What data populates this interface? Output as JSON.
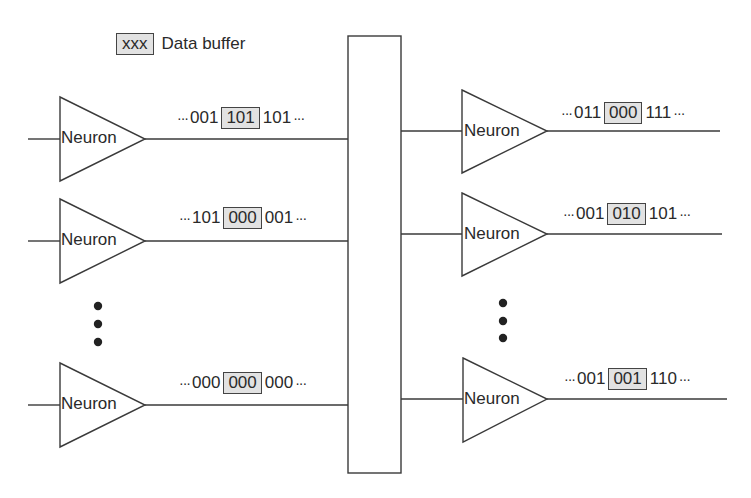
{
  "legend": {
    "swatch_text": "xxx",
    "label": "Data buffer",
    "buffer_fill": "#e2e2e2"
  },
  "neuron_label": "Neuron",
  "ellipsis": "···",
  "inputs": [
    {
      "label": "Neuron",
      "stream": {
        "before": "001",
        "buffer": "101",
        "after": "101"
      }
    },
    {
      "label": "Neuron",
      "stream": {
        "before": "101",
        "buffer": "000",
        "after": "001"
      }
    },
    {
      "label": "Neuron",
      "stream": {
        "before": "000",
        "buffer": "000",
        "after": "000"
      }
    }
  ],
  "outputs": [
    {
      "label": "Neuron",
      "stream": {
        "before": "011",
        "buffer": "000",
        "after": "111"
      }
    },
    {
      "label": "Neuron",
      "stream": {
        "before": "001",
        "buffer": "010",
        "after": "101"
      }
    },
    {
      "label": "Neuron",
      "stream": {
        "before": "001",
        "buffer": "001",
        "after": "110"
      }
    }
  ]
}
